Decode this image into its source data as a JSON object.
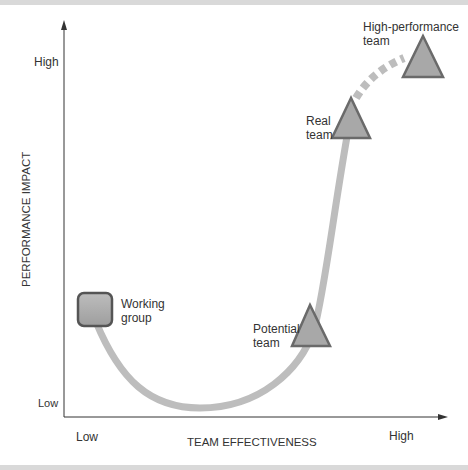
{
  "diagram": {
    "type": "team performance curve",
    "y_axis": {
      "title": "PERFORMANCE IMPACT",
      "low_label": "Low",
      "high_label": "High"
    },
    "x_axis": {
      "title": "TEAM EFFECTIVENESS",
      "low_label": "Low",
      "high_label": "High"
    },
    "nodes": [
      {
        "id": "working-group",
        "label_line1": "Working",
        "label_line2": "group",
        "shape": "rounded-square"
      },
      {
        "id": "potential-team",
        "label_line1": "Potential",
        "label_line2": "team",
        "shape": "triangle"
      },
      {
        "id": "real-team",
        "label_line1": "Real",
        "label_line2": "team",
        "shape": "triangle"
      },
      {
        "id": "high-performance-team",
        "label_line1": "High-performance",
        "label_line2": "team",
        "shape": "triangle"
      }
    ],
    "colors": {
      "curve": "#bdbdbd",
      "node_fill": "#a8a8a8",
      "node_stroke": "#555555",
      "axis": "#333333",
      "frame_bar": "#d9d9d9"
    }
  }
}
